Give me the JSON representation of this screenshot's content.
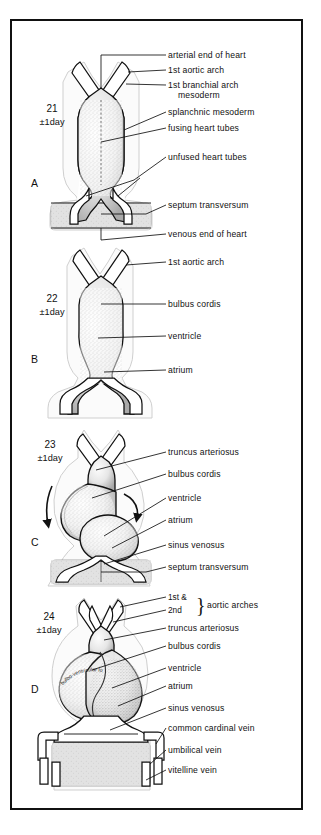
{
  "figure": {
    "border_color": "#111111",
    "background_color": "#ffffff",
    "septum_fill_color": "#dcdcdc",
    "ink_color": "#111111"
  },
  "panels": [
    {
      "letter": "A",
      "day_number": "21",
      "day_range": "±1day",
      "labels": [
        "arterial end of heart",
        "1st aortic arch",
        "1st branchial arch",
        "mesoderm",
        "splanchnic mesoderm",
        "fusing heart tubes",
        "unfused heart tubes",
        "septum transversum",
        "venous end of heart"
      ]
    },
    {
      "letter": "B",
      "day_number": "22",
      "day_range": "±1day",
      "labels": [
        "1st aortic arch",
        "bulbus cordis",
        "ventricle",
        "atrium"
      ]
    },
    {
      "letter": "C",
      "day_number": "23",
      "day_range": "±1day",
      "labels": [
        "truncus arteriosus",
        "bulbus cordis",
        "ventricle",
        "atrium",
        "sinus venosus",
        "septum transversum"
      ]
    },
    {
      "letter": "D",
      "day_number": "24",
      "day_range": "±1day",
      "loop_annotation": "bulbo-ventricular loop",
      "bracket": {
        "line1": "1st &",
        "line2": "2nd",
        "group_label": "aortic arches"
      },
      "labels": [
        "truncus arteriosus",
        "bulbus cordis",
        "ventricle",
        "atrium",
        "sinus venosus",
        "common cardinal vein",
        "umbilical vein",
        "vitelline vein"
      ]
    }
  ]
}
